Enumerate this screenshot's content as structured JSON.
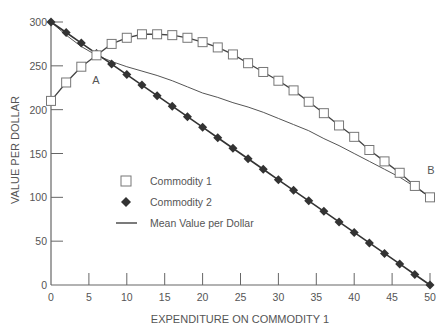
{
  "chart_data": {
    "type": "line",
    "title": "",
    "xlabel": "EXPENDITURE ON COMMODITY 1",
    "ylabel": "VALUE PER DOLLAR",
    "xlim": [
      0,
      50
    ],
    "ylim": [
      0,
      300
    ],
    "x_ticks": [
      0,
      5,
      10,
      15,
      20,
      25,
      30,
      35,
      40,
      45,
      50
    ],
    "y_ticks": [
      0,
      50,
      100,
      150,
      200,
      250,
      300
    ],
    "grid": false,
    "legend_position": "center-left",
    "x": [
      0,
      2,
      4,
      6,
      8,
      10,
      12,
      14,
      16,
      18,
      20,
      22,
      24,
      26,
      28,
      30,
      32,
      34,
      36,
      38,
      40,
      42,
      44,
      46,
      48,
      50
    ],
    "series": [
      {
        "name": "Commodity 1",
        "marker": "open-square",
        "values": [
          210,
          231,
          249,
          262,
          275,
          282,
          286,
          286,
          285,
          282,
          277,
          271,
          263,
          253,
          243,
          233,
          222,
          209,
          196,
          182,
          169,
          154,
          141,
          128,
          113,
          100
        ]
      },
      {
        "name": "Commodity 2",
        "marker": "filled-diamond",
        "values": [
          300,
          288,
          276,
          264,
          252,
          240,
          228,
          216,
          204,
          192,
          180,
          168,
          156,
          144,
          132,
          120,
          108,
          96,
          84,
          72,
          60,
          48,
          36,
          24,
          12,
          0
        ]
      },
      {
        "name": "Mean Value per Dollar",
        "marker": "none",
        "values": [
          300,
          285,
          272,
          262,
          255,
          249,
          244,
          239,
          233,
          226,
          219,
          214,
          208,
          203,
          197,
          190,
          183,
          176,
          167,
          159,
          150,
          141,
          132,
          123,
          112,
          100
        ]
      }
    ],
    "annotations": [
      {
        "text": "A",
        "x": 6,
        "y": 262
      },
      {
        "text": "B",
        "x": 50,
        "y": 100
      }
    ]
  },
  "labels": {
    "xlabel": "EXPENDITURE ON COMMODITY 1",
    "ylabel": "VALUE PER DOLLAR",
    "annotation_a": "A",
    "annotation_b": "B",
    "legend": [
      "Commodity 1",
      "Commodity 2",
      "Mean Value per Dollar"
    ]
  }
}
